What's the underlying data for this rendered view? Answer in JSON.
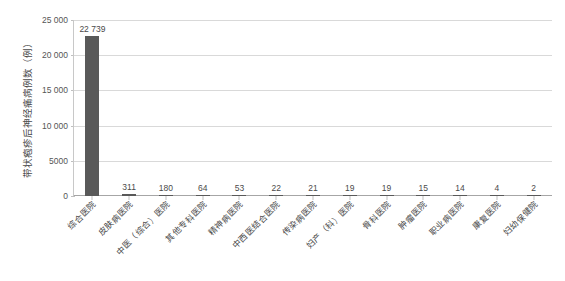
{
  "chart_data": {
    "type": "bar",
    "title": "",
    "subtitle": "",
    "xlabel": "",
    "ylabel": "带状疱疹后神经痛病例数（例）",
    "ylim": [
      0,
      25000
    ],
    "ytick_step": 5000,
    "grid": true,
    "legend": false,
    "legend_position": "none",
    "bar_color": "#595959",
    "categories": [
      "综合医院",
      "皮肤病医院",
      "中医（综合）医院",
      "其他专科医院",
      "精神病医院",
      "中西医结合医院",
      "传染病医院",
      "妇产（科）医院",
      "骨科医院",
      "肿瘤医院",
      "职业病医院",
      "康复医院",
      "妇幼保健院"
    ],
    "values": [
      22739,
      311,
      180,
      64,
      53,
      22,
      21,
      19,
      19,
      15,
      14,
      4,
      2
    ],
    "value_labels": [
      "22 739",
      "311",
      "180",
      "64",
      "53",
      "22",
      "21",
      "19",
      "19",
      "15",
      "14",
      "4",
      "2"
    ],
    "ytick_labels": [
      "0",
      "5000",
      "10 000",
      "15 000",
      "20 000",
      "25 000"
    ],
    "ytick_values": [
      0,
      5000,
      10000,
      15000,
      20000,
      25000
    ]
  },
  "caption": ""
}
